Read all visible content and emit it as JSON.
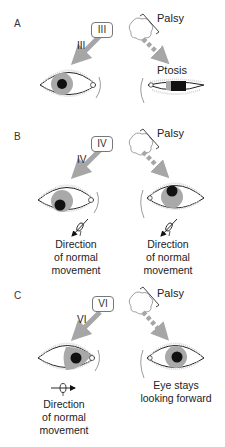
{
  "colors": {
    "arrow": "#a6a6a6",
    "iris": "#a9a9a9",
    "pupil": "#111111",
    "outline": "#222222",
    "lashes": "#bbbbbb"
  },
  "panels": [
    {
      "letter": "A",
      "nerve_box": "III",
      "arrow_label": "III",
      "palsy_label": "Palsy",
      "right_label": "Ptosis",
      "left_caption": [],
      "right_caption": []
    },
    {
      "letter": "B",
      "nerve_box": "IV",
      "arrow_label": "IV",
      "palsy_label": "Palsy",
      "right_label": "",
      "left_caption": [
        "Direction",
        "of normal",
        "movement"
      ],
      "right_caption": [
        "Direction",
        "of normal",
        "movement"
      ]
    },
    {
      "letter": "C",
      "nerve_box": "VI",
      "arrow_label": "VI",
      "palsy_label": "Palsy",
      "right_label": "",
      "left_caption": [
        "Direction",
        "of normal",
        "movement"
      ],
      "right_caption": [
        "Eye stays",
        "looking forward"
      ]
    }
  ]
}
